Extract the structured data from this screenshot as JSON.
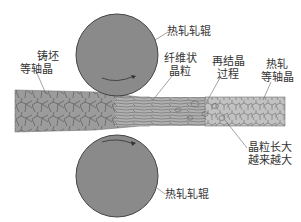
{
  "labels": {
    "top_roller": "热轧轧辊",
    "bottom_roller": "热轧轧辊",
    "cast_l1": "铸坯",
    "cast_l2": "等轴晶",
    "fiber_l1": "纤维状",
    "fiber_l2": "晶粒",
    "recryst_l1": "再结晶",
    "recryst_l2": "过程",
    "hot_l1": "热轧",
    "hot_l2": "等轴晶",
    "growth_l1": "晶粒长大",
    "growth_l2": "越来越大"
  },
  "colors": {
    "roller": "#8a8a8a",
    "strip": "#b4b4b4",
    "grain": "#6a6a6a",
    "text": "#333333"
  }
}
